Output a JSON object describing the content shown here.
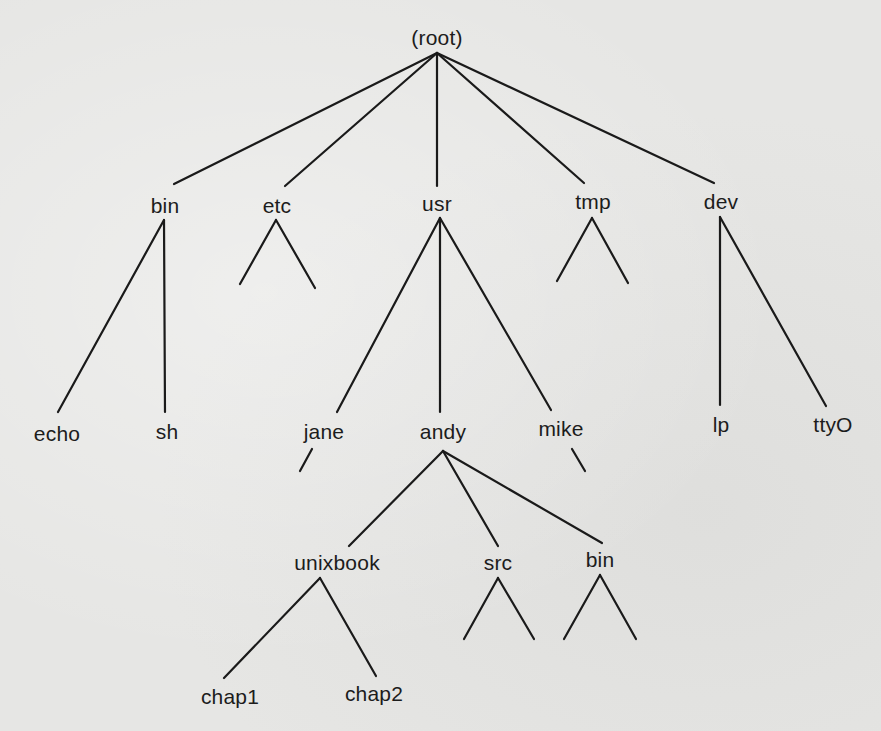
{
  "diagram": {
    "type": "tree",
    "title": "",
    "colors": {
      "background": "#e6e6e4",
      "ink": "#1a1a1a"
    },
    "nodes": {
      "root": {
        "label": "(root)",
        "x": 437,
        "y": 37
      },
      "bin": {
        "label": "bin",
        "x": 165,
        "y": 205
      },
      "etc": {
        "label": "etc",
        "x": 277,
        "y": 205
      },
      "usr": {
        "label": "usr",
        "x": 437,
        "y": 203
      },
      "tmp": {
        "label": "tmp",
        "x": 593,
        "y": 201
      },
      "dev": {
        "label": "dev",
        "x": 721,
        "y": 201
      },
      "echo": {
        "label": "echo",
        "x": 57,
        "y": 433
      },
      "sh": {
        "label": "sh",
        "x": 167,
        "y": 431
      },
      "jane": {
        "label": "jane",
        "x": 324,
        "y": 431
      },
      "andy": {
        "label": "andy",
        "x": 443,
        "y": 431
      },
      "mike": {
        "label": "mike",
        "x": 561,
        "y": 428
      },
      "lp": {
        "label": "lp",
        "x": 721,
        "y": 424
      },
      "tty0": {
        "label": "ttyO",
        "x": 833,
        "y": 424
      },
      "unixbook": {
        "label": "unixbook",
        "x": 337,
        "y": 562
      },
      "src": {
        "label": "src",
        "x": 498,
        "y": 562
      },
      "bin2": {
        "label": "bin",
        "x": 600,
        "y": 559
      },
      "chap1": {
        "label": "chap1",
        "x": 230,
        "y": 696
      },
      "chap2": {
        "label": "chap2",
        "x": 374,
        "y": 693
      }
    },
    "edges": [
      {
        "from": "root",
        "to": "bin",
        "x1": 437,
        "y1": 53,
        "x2": 174,
        "y2": 184
      },
      {
        "from": "root",
        "to": "etc",
        "x1": 437,
        "y1": 53,
        "x2": 285,
        "y2": 186
      },
      {
        "from": "root",
        "to": "usr",
        "x1": 437,
        "y1": 53,
        "x2": 437,
        "y2": 186
      },
      {
        "from": "root",
        "to": "tmp",
        "x1": 437,
        "y1": 53,
        "x2": 584,
        "y2": 183
      },
      {
        "from": "root",
        "to": "dev",
        "x1": 437,
        "y1": 53,
        "x2": 714,
        "y2": 183
      },
      {
        "from": "bin",
        "to": "echo",
        "x1": 164,
        "y1": 220,
        "x2": 58,
        "y2": 412
      },
      {
        "from": "bin",
        "to": "sh",
        "x1": 164,
        "y1": 220,
        "x2": 165,
        "y2": 412
      },
      {
        "from": "etc",
        "to": "unnamed-left",
        "x1": 276,
        "y1": 220,
        "x2": 240,
        "y2": 284
      },
      {
        "from": "etc",
        "to": "unnamed-right",
        "x1": 276,
        "y1": 220,
        "x2": 315,
        "y2": 288
      },
      {
        "from": "usr",
        "to": "jane",
        "x1": 440,
        "y1": 218,
        "x2": 337,
        "y2": 412
      },
      {
        "from": "usr",
        "to": "andy",
        "x1": 440,
        "y1": 218,
        "x2": 440,
        "y2": 412
      },
      {
        "from": "usr",
        "to": "mike",
        "x1": 440,
        "y1": 218,
        "x2": 551,
        "y2": 410
      },
      {
        "from": "tmp",
        "to": "unnamed-left",
        "x1": 592,
        "y1": 218,
        "x2": 557,
        "y2": 281
      },
      {
        "from": "tmp",
        "to": "unnamed-right",
        "x1": 592,
        "y1": 218,
        "x2": 628,
        "y2": 283
      },
      {
        "from": "dev",
        "to": "lp",
        "x1": 720,
        "y1": 217,
        "x2": 720,
        "y2": 405
      },
      {
        "from": "dev",
        "to": "ttyO",
        "x1": 720,
        "y1": 217,
        "x2": 826,
        "y2": 406
      },
      {
        "from": "jane",
        "to": "unnamed-left",
        "x1": 312,
        "y1": 449,
        "x2": 300,
        "y2": 471
      },
      {
        "from": "mike",
        "to": "unnamed-right",
        "x1": 572,
        "y1": 449,
        "x2": 585,
        "y2": 471
      },
      {
        "from": "andy",
        "to": "unixbook",
        "x1": 443,
        "y1": 451,
        "x2": 349,
        "y2": 546
      },
      {
        "from": "andy",
        "to": "src",
        "x1": 443,
        "y1": 451,
        "x2": 498,
        "y2": 546
      },
      {
        "from": "andy",
        "to": "bin2",
        "x1": 443,
        "y1": 451,
        "x2": 602,
        "y2": 543
      },
      {
        "from": "unixbook",
        "to": "chap1",
        "x1": 320,
        "y1": 578,
        "x2": 224,
        "y2": 678
      },
      {
        "from": "unixbook",
        "to": "chap2",
        "x1": 320,
        "y1": 578,
        "x2": 376,
        "y2": 676
      },
      {
        "from": "src",
        "to": "unnamed-left",
        "x1": 498,
        "y1": 578,
        "x2": 464,
        "y2": 639
      },
      {
        "from": "src",
        "to": "unnamed-right",
        "x1": 498,
        "y1": 578,
        "x2": 534,
        "y2": 639
      },
      {
        "from": "bin2",
        "to": "unnamed-left",
        "x1": 600,
        "y1": 575,
        "x2": 564,
        "y2": 639
      },
      {
        "from": "bin2",
        "to": "unnamed-right",
        "x1": 600,
        "y1": 575,
        "x2": 636,
        "y2": 639
      }
    ]
  }
}
